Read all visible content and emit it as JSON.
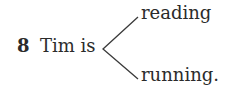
{
  "exercise": {
    "number": "8",
    "stem": "Tim is",
    "options": [
      "reading",
      "running."
    ]
  }
}
